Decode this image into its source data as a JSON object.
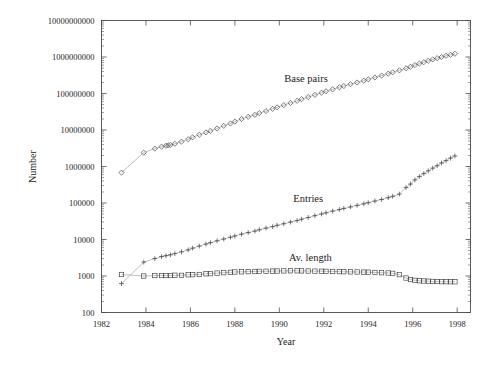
{
  "chart_data": {
    "type": "line",
    "title": "",
    "xlabel": "Year",
    "ylabel": "Number",
    "yscale": "log",
    "xlim": [
      1982,
      1998.6
    ],
    "ylim": [
      100,
      10000000000
    ],
    "grid": false,
    "legend_position": "inline-annotations",
    "xticks": [
      1982,
      1984,
      1986,
      1988,
      1990,
      1992,
      1994,
      1996,
      1998
    ],
    "xtick_labels": [
      "1982",
      "1984",
      "1986",
      "1988",
      "1990",
      "1992",
      "1994",
      "1996",
      "1998"
    ],
    "yticks": [
      100,
      1000,
      10000,
      100000,
      1000000,
      10000000,
      100000000,
      1000000000,
      10000000000
    ],
    "ytick_labels": [
      "100",
      "1000",
      "10000",
      "100000",
      "1000000",
      "10000000",
      "100000000",
      "1000000000",
      "10000000000"
    ],
    "series": [
      {
        "name": "Base pairs",
        "marker": "diamond",
        "annotation": "Base pairs",
        "annotation_x": 1991.2,
        "annotation_y": 210000000,
        "x": [
          1982.9,
          1983.9,
          1984.4,
          1984.7,
          1984.9,
          1985.0,
          1985.1,
          1985.3,
          1985.6,
          1985.9,
          1986.1,
          1986.4,
          1986.7,
          1986.9,
          1987.2,
          1987.5,
          1987.8,
          1988.0,
          1988.3,
          1988.6,
          1988.9,
          1989.1,
          1989.4,
          1989.7,
          1989.9,
          1990.2,
          1990.5,
          1990.8,
          1991.0,
          1991.3,
          1991.6,
          1991.9,
          1992.1,
          1992.4,
          1992.7,
          1992.9,
          1993.2,
          1993.5,
          1993.8,
          1994.0,
          1994.3,
          1994.6,
          1994.9,
          1995.1,
          1995.4,
          1995.7,
          1995.9,
          1996.1,
          1996.3,
          1996.5,
          1996.7,
          1996.9,
          1997.1,
          1997.3,
          1997.5,
          1997.7,
          1997.9
        ],
        "y": [
          680000,
          2400000,
          3100000,
          3500000,
          3700000,
          3800000,
          3900000,
          4200000,
          4800000,
          5600000,
          6300000,
          7400000,
          8600000,
          9500000,
          11000000,
          13000000,
          15000000,
          17000000,
          20000000,
          23000000,
          26000000,
          29000000,
          33000000,
          38000000,
          42000000,
          48000000,
          55000000,
          63000000,
          70000000,
          80000000,
          92000000,
          105000000,
          115000000,
          130000000,
          148000000,
          160000000,
          180000000,
          200000000,
          225000000,
          245000000,
          275000000,
          310000000,
          350000000,
          380000000,
          430000000,
          490000000,
          540000000,
          600000000,
          660000000,
          720000000,
          790000000,
          860000000,
          930000000,
          1000000000,
          1080000000,
          1150000000,
          1230000000
        ]
      },
      {
        "name": "Entries",
        "marker": "plus",
        "annotation": "Entries",
        "annotation_x": 1991.3,
        "annotation_y": 105000,
        "x": [
          1982.9,
          1983.9,
          1984.4,
          1984.7,
          1984.9,
          1985.1,
          1985.3,
          1985.6,
          1985.9,
          1986.1,
          1986.4,
          1986.7,
          1986.9,
          1987.2,
          1987.5,
          1987.8,
          1988.0,
          1988.3,
          1988.6,
          1988.9,
          1989.1,
          1989.4,
          1989.7,
          1989.9,
          1990.2,
          1990.5,
          1990.8,
          1991.0,
          1991.3,
          1991.6,
          1991.9,
          1992.1,
          1992.4,
          1992.7,
          1992.9,
          1993.2,
          1993.5,
          1993.8,
          1994.0,
          1994.3,
          1994.6,
          1994.9,
          1995.1,
          1995.4,
          1995.7,
          1995.9,
          1996.1,
          1996.3,
          1996.5,
          1996.7,
          1996.9,
          1997.1,
          1997.3,
          1997.5,
          1997.7,
          1997.9
        ],
        "y": [
          620,
          2400,
          3000,
          3400,
          3600,
          3800,
          4100,
          4600,
          5200,
          5800,
          6600,
          7500,
          8200,
          9200,
          10300,
          11500,
          12500,
          14000,
          15500,
          17000,
          18500,
          20500,
          22500,
          24500,
          27000,
          30000,
          33000,
          36000,
          40000,
          45000,
          50000,
          54000,
          60000,
          66000,
          71000,
          78000,
          86000,
          95000,
          102000,
          113000,
          125000,
          140000,
          152000,
          175000,
          265000,
          330000,
          430000,
          530000,
          640000,
          760000,
          900000,
          1050000,
          1250000,
          1450000,
          1700000,
          1950000
        ]
      },
      {
        "name": "Av. length",
        "marker": "square",
        "annotation": "Av. length",
        "annotation_x": 1991.4,
        "annotation_y": 2600,
        "x": [
          1982.9,
          1983.9,
          1984.4,
          1984.7,
          1984.9,
          1985.1,
          1985.3,
          1985.6,
          1985.9,
          1986.1,
          1986.4,
          1986.7,
          1986.9,
          1987.2,
          1987.5,
          1987.8,
          1988.0,
          1988.3,
          1988.6,
          1988.9,
          1989.1,
          1989.4,
          1989.7,
          1989.9,
          1990.2,
          1990.5,
          1990.8,
          1991.0,
          1991.3,
          1991.6,
          1991.9,
          1992.1,
          1992.4,
          1992.7,
          1992.9,
          1993.2,
          1993.5,
          1993.8,
          1994.0,
          1994.3,
          1994.6,
          1994.9,
          1995.1,
          1995.4,
          1995.7,
          1995.9,
          1996.1,
          1996.3,
          1996.5,
          1996.7,
          1996.9,
          1997.1,
          1997.3,
          1997.5,
          1997.7,
          1997.9
        ],
        "y": [
          1100,
          1000,
          1030,
          1030,
          1030,
          1030,
          1050,
          1040,
          1080,
          1090,
          1100,
          1150,
          1160,
          1200,
          1230,
          1260,
          1290,
          1300,
          1320,
          1330,
          1340,
          1350,
          1360,
          1370,
          1380,
          1390,
          1390,
          1380,
          1370,
          1360,
          1350,
          1340,
          1330,
          1320,
          1310,
          1300,
          1290,
          1280,
          1270,
          1250,
          1230,
          1210,
          1180,
          1090,
          880,
          800,
          760,
          740,
          730,
          720,
          710,
          705,
          700,
          700,
          698,
          695
        ]
      }
    ]
  }
}
